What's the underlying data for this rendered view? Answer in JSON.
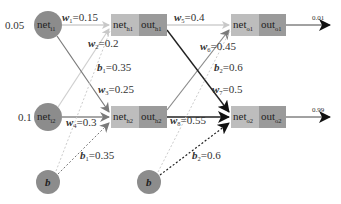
{
  "colors": {
    "circle": "#8c8c8c",
    "net_box": "#bdbdbd",
    "out_box": "#9a9a9a",
    "light_edge": "#c8c8c8",
    "mid_edge": "#8a8a8a",
    "dark_edge": "#222222"
  },
  "inputs": [
    {
      "id": "i1",
      "value": "0.05",
      "label": "net",
      "sub": "i1"
    },
    {
      "id": "i2",
      "value": "0.1",
      "label": "net",
      "sub": "i2"
    }
  ],
  "biases": [
    {
      "id": "b1",
      "label": "b"
    },
    {
      "id": "b2",
      "label": "b"
    }
  ],
  "hidden": [
    {
      "id": "h1",
      "net": "net",
      "net_sub": "h1",
      "out": "out",
      "out_sub": "h1"
    },
    {
      "id": "h2",
      "net": "net",
      "net_sub": "h2",
      "out": "out",
      "out_sub": "h2"
    }
  ],
  "outputs": [
    {
      "id": "o1",
      "net": "net",
      "net_sub": "o1",
      "out": "out",
      "out_sub": "o1",
      "target": "0.01"
    },
    {
      "id": "o2",
      "net": "net",
      "net_sub": "o2",
      "out": "out",
      "out_sub": "o2",
      "target": "0.99"
    }
  ],
  "weights": [
    {
      "name": "w",
      "sub": "1",
      "value": "=0.15"
    },
    {
      "name": "w",
      "sub": "2",
      "value": "=0.2"
    },
    {
      "name": "w",
      "sub": "3",
      "value": "=0.25"
    },
    {
      "name": "w",
      "sub": "4",
      "value": "=0.3"
    },
    {
      "name": "w",
      "sub": "5",
      "value": "=0.4"
    },
    {
      "name": "w",
      "sub": "6",
      "value": "=0.45"
    },
    {
      "name": "w",
      "sub": "7",
      "value": "=0.5"
    },
    {
      "name": "w",
      "sub": "8",
      "value": "=0.55"
    }
  ],
  "bias_labels": [
    {
      "name": "b",
      "sub": "1",
      "value": "=0.35",
      "pos": "upper"
    },
    {
      "name": "b",
      "sub": "1",
      "value": "=0.35",
      "pos": "lower"
    },
    {
      "name": "b",
      "sub": "2",
      "value": "=0.6",
      "pos": "upper"
    },
    {
      "name": "b",
      "sub": "2",
      "value": "=0.6",
      "pos": "lower"
    }
  ]
}
